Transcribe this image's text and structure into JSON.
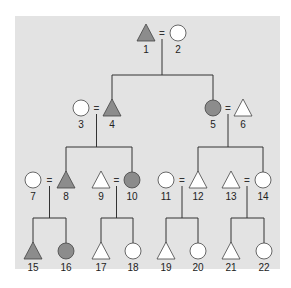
{
  "diagram": {
    "type": "pedigree",
    "colors": {
      "background": "#e3e3e3",
      "affected": "#8c8c8c",
      "unaffected": "#ffffff",
      "stroke": "#444444",
      "line": "#333333"
    },
    "individuals": [
      {
        "id": "1",
        "shape": "triangle",
        "affected": true,
        "x": 146,
        "y": 33
      },
      {
        "id": "2",
        "shape": "circle",
        "affected": false,
        "x": 178,
        "y": 33
      },
      {
        "id": "3",
        "shape": "circle",
        "affected": false,
        "x": 81,
        "y": 108
      },
      {
        "id": "4",
        "shape": "triangle",
        "affected": true,
        "x": 112,
        "y": 108
      },
      {
        "id": "5",
        "shape": "circle",
        "affected": true,
        "x": 213,
        "y": 108
      },
      {
        "id": "6",
        "shape": "triangle",
        "affected": false,
        "x": 243,
        "y": 108
      },
      {
        "id": "7",
        "shape": "circle",
        "affected": false,
        "x": 33,
        "y": 180
      },
      {
        "id": "8",
        "shape": "triangle",
        "affected": true,
        "x": 66,
        "y": 180
      },
      {
        "id": "9",
        "shape": "triangle",
        "affected": false,
        "x": 101,
        "y": 180
      },
      {
        "id": "10",
        "shape": "circle",
        "affected": true,
        "x": 132,
        "y": 180
      },
      {
        "id": "11",
        "shape": "circle",
        "affected": false,
        "x": 166,
        "y": 180
      },
      {
        "id": "12",
        "shape": "triangle",
        "affected": false,
        "x": 198,
        "y": 180
      },
      {
        "id": "13",
        "shape": "triangle",
        "affected": false,
        "x": 231,
        "y": 180
      },
      {
        "id": "14",
        "shape": "circle",
        "affected": false,
        "x": 263,
        "y": 180
      },
      {
        "id": "15",
        "shape": "triangle",
        "affected": true,
        "x": 33,
        "y": 251
      },
      {
        "id": "16",
        "shape": "circle",
        "affected": true,
        "x": 66,
        "y": 251
      },
      {
        "id": "17",
        "shape": "triangle",
        "affected": false,
        "x": 101,
        "y": 251
      },
      {
        "id": "18",
        "shape": "circle",
        "affected": false,
        "x": 133,
        "y": 251
      },
      {
        "id": "19",
        "shape": "triangle",
        "affected": false,
        "x": 166,
        "y": 251
      },
      {
        "id": "20",
        "shape": "circle",
        "affected": false,
        "x": 198,
        "y": 251
      },
      {
        "id": "21",
        "shape": "triangle",
        "affected": false,
        "x": 231,
        "y": 251
      },
      {
        "id": "22",
        "shape": "circle",
        "affected": false,
        "x": 264,
        "y": 251
      }
    ],
    "matings": [
      {
        "a": "1",
        "b": "2",
        "symbol": "=",
        "children": [
          "4",
          "5"
        ]
      },
      {
        "a": "3",
        "b": "4",
        "symbol": "=",
        "children": [
          "8",
          "10"
        ]
      },
      {
        "a": "5",
        "b": "6",
        "symbol": "=",
        "children": [
          "12",
          "14"
        ]
      },
      {
        "a": "7",
        "b": "8",
        "symbol": "=",
        "children": [
          "15",
          "16"
        ]
      },
      {
        "a": "9",
        "b": "10",
        "symbol": "=",
        "children": [
          "17",
          "18"
        ]
      },
      {
        "a": "11",
        "b": "12",
        "symbol": "=",
        "children": [
          "19",
          "20"
        ]
      },
      {
        "a": "13",
        "b": "14",
        "symbol": "=",
        "children": [
          "21",
          "22"
        ]
      }
    ]
  }
}
